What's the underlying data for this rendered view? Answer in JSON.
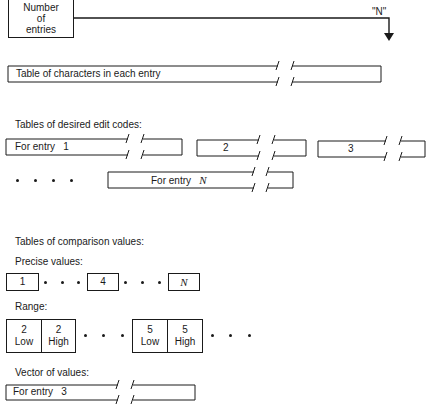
{
  "header": {
    "number_box_lines": [
      "Number",
      "of",
      "entries"
    ],
    "arrow_label": "\"N\""
  },
  "char_table": {
    "label": "Table of characters in each entry"
  },
  "edit_codes": {
    "title": "Tables of desired edit codes:",
    "entry1_prefix": "For entry",
    "entry1_number": "1",
    "entry2_label": "2",
    "entry3_label": "3",
    "entryN_prefix": "For entry",
    "entryN_var": "N"
  },
  "comparison": {
    "title": "Tables of comparison values:",
    "precise_label": "Precise values:",
    "precise_values": [
      "1",
      "4",
      "N"
    ],
    "range_label": "Range:",
    "range_cells": [
      {
        "num": "2",
        "word": "Low"
      },
      {
        "num": "2",
        "word": "High"
      },
      {
        "num": "5",
        "word": "Low"
      },
      {
        "num": "5",
        "word": "High"
      }
    ],
    "vector_label": "Vector of values:",
    "vector_prefix": "For entry",
    "vector_number": "3"
  }
}
